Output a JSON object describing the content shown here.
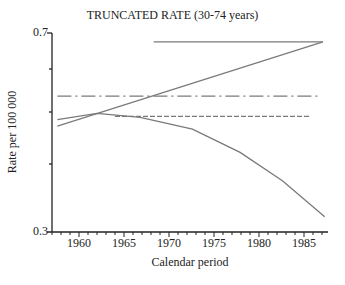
{
  "chart_data": {
    "type": "line",
    "title": "TRUNCATED RATE (30-74 years)",
    "xlabel": "Calendar period",
    "ylabel": "Rate per 100 000",
    "yscale": "log",
    "ylim": [
      0.3,
      0.7
    ],
    "xlim": [
      1957,
      1987.7
    ],
    "y_tick_labels": [
      "0.7",
      "0.3"
    ],
    "y_minor_ticks": [
      0.6,
      0.5,
      0.4
    ],
    "x_tick_labels": [
      "1960",
      "1965",
      "1970",
      "1975",
      "1980",
      "1985"
    ],
    "grid": false,
    "legend": null,
    "series": [
      {
        "name": "observed rate (solid, falling)",
        "style": "solid",
        "x": [
          1957.6,
          1962.0,
          1966.8,
          1972.6,
          1977.9,
          1982.6,
          1987.3
        ],
        "y": [
          0.484,
          0.497,
          0.489,
          0.465,
          0.421,
          0.373,
          0.32
        ]
      },
      {
        "name": "linear trend (solid, rising)",
        "style": "solid",
        "x": [
          1957.6,
          1987.1
        ],
        "y": [
          0.471,
          0.674
        ]
      },
      {
        "name": "horizontal reference (solid, top)",
        "style": "solid",
        "x": [
          1968.3,
          1987.1
        ],
        "y": [
          0.674,
          0.674
        ]
      },
      {
        "name": "dash-dot reference",
        "style": "dash-dot",
        "x": [
          1957.6,
          1986.7
        ],
        "y": [
          0.535,
          0.535
        ]
      },
      {
        "name": "dashed reference",
        "style": "dashed",
        "x": [
          1964.0,
          1985.7
        ],
        "y": [
          0.491,
          0.491
        ]
      }
    ]
  },
  "labels": {
    "title": "TRUNCATED RATE (30-74 years)",
    "xlabel": "Calendar period",
    "ylabel": "Rate per 100 000",
    "ytick_top": "0.7",
    "ytick_bottom": "0.3",
    "xticks": [
      "1960",
      "1965",
      "1970",
      "1975",
      "1980",
      "1985"
    ]
  },
  "colors": {
    "axis": "#222222",
    "line": "#7a7a7a"
  }
}
